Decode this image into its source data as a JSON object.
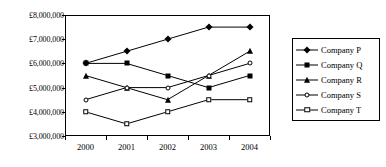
{
  "chart_data": {
    "type": "line",
    "title": "",
    "xlabel": "",
    "ylabel": "",
    "categories": [
      "2000",
      "2001",
      "2002",
      "2003",
      "2004"
    ],
    "ylim": [
      3000000,
      8000000
    ],
    "ytick_values": [
      8000000,
      7000000,
      6000000,
      5000000,
      4000000,
      3000000
    ],
    "ytick_labels": [
      "£8,000,000",
      "£7,000,000",
      "£6,000,000",
      "£5,000,000",
      "£4,000,000",
      "£3,000,000"
    ],
    "grid": false,
    "legend_position": "right",
    "series": [
      {
        "name": "Company P",
        "marker": "filled-diamond",
        "values": [
          6000000,
          6500000,
          7000000,
          7500000,
          7500000
        ]
      },
      {
        "name": "Company Q",
        "marker": "filled-square",
        "values": [
          6000000,
          6000000,
          5500000,
          5000000,
          5500000
        ]
      },
      {
        "name": "Company R",
        "marker": "filled-triangle",
        "values": [
          5500000,
          5000000,
          4500000,
          5500000,
          6500000
        ]
      },
      {
        "name": "Company S",
        "marker": "open-circle",
        "values": [
          4500000,
          5000000,
          5000000,
          5500000,
          6000000
        ]
      },
      {
        "name": "Company T",
        "marker": "open-square",
        "values": [
          4000000,
          3500000,
          4000000,
          4500000,
          4500000
        ]
      }
    ]
  },
  "legend": {
    "items": [
      {
        "label": "Company P"
      },
      {
        "label": "Company Q"
      },
      {
        "label": "Company R"
      },
      {
        "label": "Company S"
      },
      {
        "label": "Company T"
      }
    ]
  },
  "colors": {
    "series": "#000000",
    "axis": "#000000",
    "background": "#ffffff"
  }
}
